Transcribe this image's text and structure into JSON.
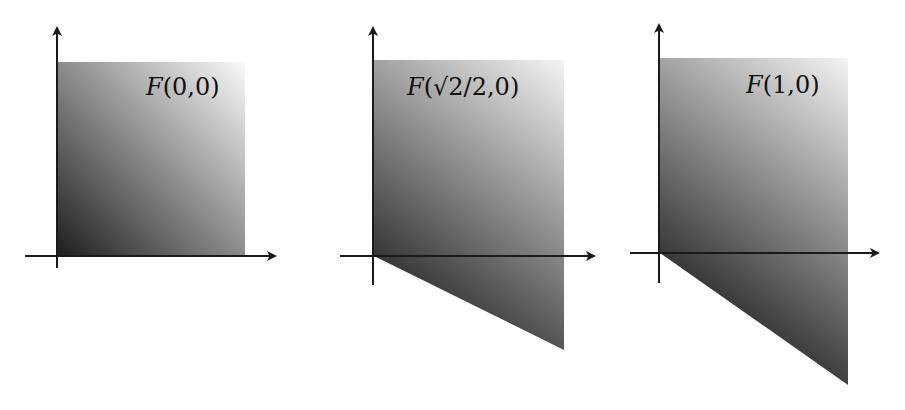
{
  "panels": [
    {
      "label": "F(0,0)",
      "fn": "F",
      "arg1": "0",
      "arg2": "0",
      "shear": 0
    },
    {
      "label": "F(√2/2,0)",
      "fn": "F",
      "arg1_root": "2",
      "arg1_rest": "/2",
      "arg2": "0",
      "shear": 0.7071
    },
    {
      "label": "F(1,0)",
      "fn": "F",
      "arg1": "1",
      "arg2": "0",
      "shear": 1
    }
  ],
  "colors": {
    "axis": "#1a1a1a",
    "fill_dark": "#1e1e1e",
    "fill_light": "#fafafa",
    "background": "#ffffff"
  }
}
